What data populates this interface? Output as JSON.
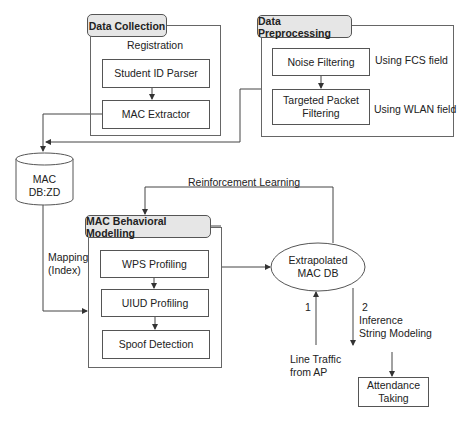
{
  "diagram": {
    "data_collection": {
      "title": "Data Collection",
      "subtitle": "Registration",
      "steps": [
        "Student ID Parser",
        "MAC Extractor"
      ]
    },
    "data_preprocessing": {
      "title": "Data Preprocessing",
      "steps": [
        "Noise Filtering",
        "Targeted Packet Filtering"
      ],
      "annotations": [
        "Using FCS field",
        "Using WLAN field"
      ]
    },
    "mac_db": {
      "line1": "MAC",
      "line2": "DB:ZD"
    },
    "mapping_label": {
      "line1": "Mapping",
      "line2": "(Index)"
    },
    "reinforcement_label": "Reinforcement Learning",
    "mac_behavioral": {
      "title": "MAC Behavioral Modelling",
      "steps": [
        "WPS Profiling",
        "UIUD Profiling",
        "Spoof Detection"
      ]
    },
    "extrapolated_db": {
      "line1": "Extrapolated",
      "line2": "MAC DB"
    },
    "line_traffic": {
      "number": "1",
      "line1": "Line Traffic",
      "line2": "from AP"
    },
    "inference": {
      "number": "2",
      "line1": "Inference",
      "line2": "String Modeling"
    },
    "attendance": {
      "line1": "Attendance",
      "line2": "Taking"
    },
    "colors": {
      "tab_fill": "#e6e6e6",
      "stroke": "#555555",
      "background": "#ffffff"
    }
  }
}
